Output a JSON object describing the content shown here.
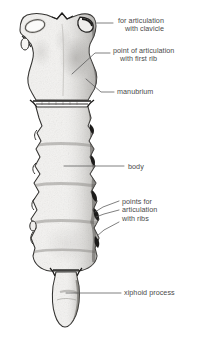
{
  "figure": {
    "view": "anterior",
    "background_color": "#ffffff",
    "ink_color": "#2b2b2b",
    "bone_fill_color": "#f2f1ef",
    "shadow_color": "#9a9894",
    "label_color": "#4a4a4a",
    "leader_color": "#555555"
  },
  "labels": [
    {
      "name": "for-articulation-with-clavicle",
      "lines": [
        "for articulation",
        "with clavicle"
      ],
      "x": 118,
      "y": 17,
      "indent_lines": [
        false,
        true
      ]
    },
    {
      "name": "point-of-articulation-with-first-rib",
      "lines": [
        "point of articulation",
        "with first rib"
      ],
      "x": 113,
      "y": 47,
      "indent_lines": [
        false,
        true
      ]
    },
    {
      "name": "manubrium",
      "lines": [
        "manubrium"
      ],
      "x": 117,
      "y": 88,
      "indent_lines": [
        false
      ]
    },
    {
      "name": "body",
      "lines": [
        "body"
      ],
      "x": 128,
      "y": 163,
      "indent_lines": [
        false
      ]
    },
    {
      "name": "points-for-articulation-with-ribs",
      "lines": [
        "points for",
        "articulation",
        "with ribs"
      ],
      "x": 122,
      "y": 198,
      "indent_lines": [
        false,
        false,
        false
      ]
    },
    {
      "name": "xiphoid-process",
      "lines": [
        "xiphoid process"
      ],
      "x": 124,
      "y": 289,
      "indent_lines": [
        false
      ]
    }
  ],
  "leaders": [
    {
      "name": "leader-clavicle",
      "points": "113,23 96,23"
    },
    {
      "name": "leader-first-rib",
      "points": "110,53 95,53 72,74"
    },
    {
      "name": "leader-manubrium",
      "points": "114,92 101,92 86,79"
    },
    {
      "name": "leader-body",
      "points": "124,166 64,166"
    },
    {
      "name": "leader-rib-1",
      "points": "119,201 103,207 95,212"
    },
    {
      "name": "leader-rib-2",
      "points": "119,210 104,214 96,217"
    },
    {
      "name": "leader-rib-3",
      "points": "119,222 104,230 97,236"
    },
    {
      "name": "leader-xiphoid",
      "points": "121,293 66,293"
    }
  ]
}
